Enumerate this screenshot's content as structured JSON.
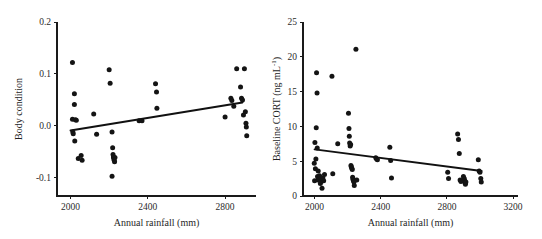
{
  "figure": {
    "background_color": "#ffffff",
    "point_color": "#141414",
    "line_color": "#111111",
    "axis_color": "#1a1a1a"
  },
  "chart_data": [
    {
      "type": "scatter",
      "panel": "left",
      "title": "",
      "xlabel": "Annual rainfall (mm)",
      "ylabel": "Body condition",
      "xlim": [
        1930,
        2960
      ],
      "ylim": [
        -0.135,
        0.2
      ],
      "xticks": [
        2000,
        2400,
        2800
      ],
      "xtick_labels": [
        "2000",
        "2400",
        "2800"
      ],
      "yticks": [
        -0.1,
        0.0,
        0.1,
        0.2
      ],
      "ytick_labels": [
        "-0.1",
        "0.0",
        "0.1",
        "0.2"
      ],
      "grid": false,
      "legend": "none",
      "trendline": {
        "x": [
          2000,
          2890
        ],
        "y": [
          -0.009,
          0.045
        ]
      },
      "x": [
        2010,
        2020,
        2020,
        2025,
        2010,
        2012,
        2014,
        2030,
        2022,
        2040,
        2055,
        2060,
        2120,
        2135,
        2200,
        2205,
        2215,
        2218,
        2220,
        2222,
        2224,
        2226,
        2228,
        2215,
        2230,
        2355,
        2370,
        2440,
        2445,
        2447,
        2800,
        2830,
        2835,
        2845,
        2860,
        2880,
        2885,
        2890,
        2895,
        2900,
        2905,
        2908,
        2910,
        2912
      ],
      "y": [
        0.122,
        0.062,
        0.041,
        0.012,
        0.013,
        -0.012,
        -0.015,
        0.011,
        -0.029,
        -0.063,
        -0.057,
        -0.066,
        0.023,
        -0.016,
        0.108,
        0.082,
        -0.012,
        -0.042,
        -0.055,
        -0.06,
        -0.063,
        -0.066,
        -0.069,
        -0.097,
        -0.061,
        0.01,
        0.01,
        0.081,
        0.065,
        0.034,
        0.017,
        0.053,
        0.049,
        0.038,
        0.11,
        0.075,
        0.053,
        0.05,
        0.021,
        0.11,
        0.027,
        0.005,
        -0.002,
        -0.019
      ]
    },
    {
      "type": "scatter",
      "panel": "right",
      "title": "",
      "xlabel": "Annual rainfall (mm)",
      "ylabel": "Baseline CORT (ng mL",
      "ylabel_sup": "-1",
      "ylabel_suffix": ")",
      "xlim": [
        1930,
        3230
      ],
      "ylim": [
        0,
        25
      ],
      "xticks": [
        2000,
        2400,
        2800,
        3200
      ],
      "xtick_labels": [
        "2000",
        "2400",
        "2800",
        "3200"
      ],
      "yticks": [
        0,
        5,
        10,
        15,
        20,
        25
      ],
      "ytick_labels": [
        "0",
        "5",
        "10",
        "15",
        "20",
        "25"
      ],
      "grid": false,
      "legend": "none",
      "trendline": {
        "x": [
          2000,
          3010
        ],
        "y": [
          6.7,
          3.6
        ]
      },
      "x": [
        1998,
        2000,
        2002,
        2005,
        2008,
        2010,
        2012,
        2015,
        2016,
        2018,
        2020,
        2022,
        2025,
        2030,
        2035,
        2040,
        2045,
        2050,
        2055,
        2060,
        2105,
        2110,
        2140,
        2205,
        2208,
        2210,
        2212,
        2215,
        2218,
        2220,
        2222,
        2225,
        2228,
        2230,
        2232,
        2235,
        2238,
        2240,
        2250,
        2255,
        2370,
        2375,
        2380,
        2455,
        2460,
        2465,
        2805,
        2810,
        2865,
        2870,
        2875,
        2880,
        2885,
        2900,
        2905,
        2908,
        2910,
        2912,
        2915,
        2990,
        2995,
        3000,
        3005,
        3008
      ],
      "y": [
        4.7,
        2.2,
        7.7,
        3.9,
        5.3,
        9.8,
        17.7,
        14.8,
        6.9,
        2.8,
        2.3,
        3.6,
        2.4,
        2.9,
        1.8,
        2.1,
        1.1,
        2.6,
        2.2,
        3.1,
        17.2,
        3.2,
        7.5,
        11.9,
        9.7,
        8.6,
        7.6,
        7.2,
        7.4,
        4.4,
        4.2,
        4.0,
        3.8,
        2.7,
        2.4,
        2.2,
        2.0,
        1.5,
        21.1,
        2.3,
        5.5,
        5.3,
        5.2,
        7.0,
        5.1,
        2.6,
        3.4,
        2.5,
        8.9,
        8.1,
        6.1,
        2.3,
        2.1,
        2.8,
        2.5,
        2.2,
        1.9,
        1.7,
        2.0,
        5.2,
        3.6,
        3.4,
        2.5,
        2.0
      ]
    }
  ]
}
